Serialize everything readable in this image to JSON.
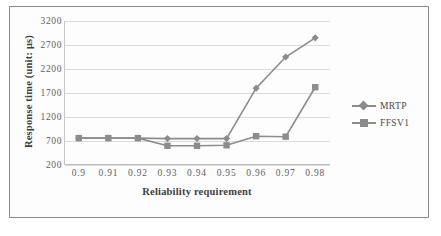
{
  "chart_data": {
    "type": "line",
    "title": "",
    "xlabel": "Reliability requirement",
    "ylabel": "Response time (unit: μs)",
    "categories": [
      "0.9",
      "0.91",
      "0.92",
      "0.93",
      "0.94",
      "0.95",
      "0.96",
      "0.97",
      "0.98"
    ],
    "ylim": [
      200,
      3200
    ],
    "yticks": [
      "200",
      "700",
      "1200",
      "1700",
      "2200",
      "2700",
      "3200"
    ],
    "ytick_values": [
      200,
      700,
      1200,
      1700,
      2200,
      2700,
      3200
    ],
    "grid": true,
    "legend_position": "right",
    "series": [
      {
        "name": "MRTP",
        "marker": "diamond",
        "color": "#8c8c8c",
        "values": [
          760,
          760,
          760,
          750,
          750,
          750,
          1800,
          2450,
          2850
        ]
      },
      {
        "name": "FFSV1",
        "marker": "square",
        "color": "#8c8c8c",
        "values": [
          760,
          760,
          760,
          600,
          600,
          610,
          800,
          790,
          1820
        ]
      }
    ]
  },
  "legend": {
    "items": [
      {
        "label": "MRTP",
        "marker": "diamond-marker"
      },
      {
        "label": "FFSV1",
        "marker": "square-marker"
      }
    ]
  },
  "colors": {
    "series": "#8c8c8c",
    "grid": "#dcdcdc",
    "axis": "#bdbdbd",
    "text": "#5e5e5e",
    "title_text": "#3f3f3f",
    "frame": "#8a8a8a",
    "background": "#ffffff"
  }
}
